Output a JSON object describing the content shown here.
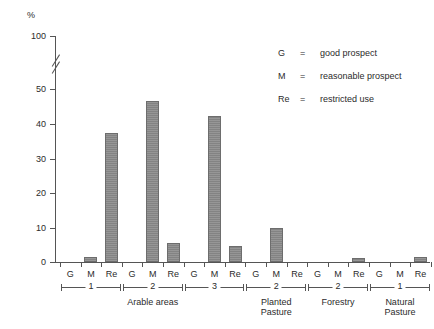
{
  "chart_data": {
    "type": "bar",
    "title": "",
    "subtitle": "",
    "xlabel": "",
    "ylabel": "%",
    "ylim": [
      0,
      100
    ],
    "y_axis_break": true,
    "y_break_between": [
      50,
      100
    ],
    "ytick_labels": [
      "100",
      "50",
      "40",
      "30",
      "20",
      "10",
      "0"
    ],
    "ytick_values": [
      100,
      50,
      40,
      30,
      20,
      10,
      0
    ],
    "grid": false,
    "legend_position": "upper-right",
    "legend": [
      {
        "key": "G",
        "eq": "=",
        "desc": "good prospect"
      },
      {
        "key": "M",
        "eq": "=",
        "desc": "reasonable prospect"
      },
      {
        "key": "Re",
        "eq": "=",
        "desc": "restricted use"
      }
    ],
    "categories": [
      "G",
      "M",
      "Re"
    ],
    "groups": [
      {
        "number": "1",
        "section": "Arable areas",
        "values": [
          0,
          1.5,
          37.4
        ]
      },
      {
        "number": "2",
        "section": "Arable areas",
        "values": [
          0,
          46.6,
          5.5
        ]
      },
      {
        "number": "3",
        "section": "Arable areas",
        "values": [
          0,
          42.3,
          4.5
        ]
      },
      {
        "number": "2",
        "section": "Planted\nPasture",
        "values": [
          0,
          9.8,
          0
        ]
      },
      {
        "number": "2",
        "section": "Forestry",
        "values": [
          0,
          0,
          1.2
        ]
      },
      {
        "number": "1",
        "section": "Natural\nPasture",
        "values": [
          0,
          0,
          1.4
        ]
      }
    ],
    "sections": [
      {
        "label": "Arable areas",
        "group_numbers": [
          "1",
          "2",
          "3"
        ]
      },
      {
        "label": "Planted\nPasture",
        "group_numbers": [
          "2"
        ]
      },
      {
        "label": "Forestry",
        "group_numbers": [
          "2"
        ]
      },
      {
        "label": "Natural\nPasture",
        "group_numbers": [
          "1"
        ]
      }
    ],
    "bar_color": "#8a8a8a",
    "bar_edge_color": "#6d6d6d",
    "axis_color": "#555555"
  }
}
